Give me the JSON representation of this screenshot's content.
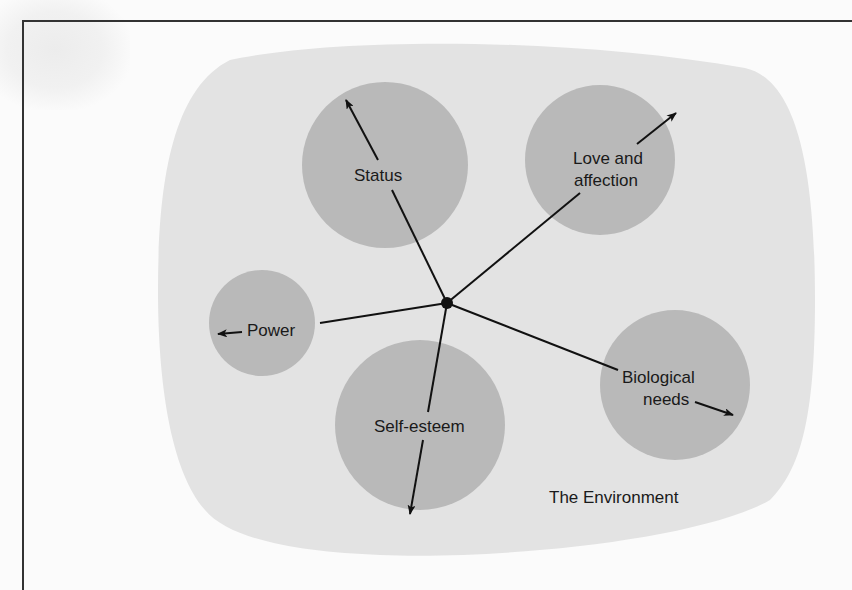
{
  "diagram": {
    "environment": {
      "label": "The Environment",
      "color": "#e3e3e3"
    },
    "center_node": {
      "x": 447,
      "y": 303,
      "color": "#111111"
    },
    "needs_color": "#b9b9b9",
    "needs": [
      {
        "id": "status",
        "label": "Status",
        "lines": [
          "Status"
        ],
        "cx": 385,
        "cy": 165,
        "r": 83
      },
      {
        "id": "love-and-affection",
        "label": "Love and affection",
        "lines": [
          "Love and",
          "affection"
        ],
        "cx": 600,
        "cy": 160,
        "r": 75
      },
      {
        "id": "power",
        "label": "Power",
        "lines": [
          "Power"
        ],
        "cx": 262,
        "cy": 323,
        "r": 53
      },
      {
        "id": "self-esteem",
        "label": "Self-esteem",
        "lines": [
          "Self-esteem"
        ],
        "cx": 420,
        "cy": 425,
        "r": 85
      },
      {
        "id": "biological-needs",
        "label": "Biological needs",
        "lines": [
          "Biological",
          "needs"
        ],
        "cx": 675,
        "cy": 385,
        "r": 75
      }
    ]
  }
}
